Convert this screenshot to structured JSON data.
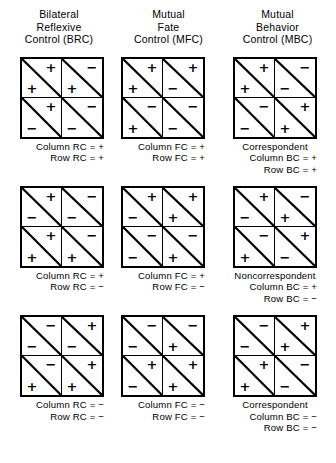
{
  "figure": {
    "column_headers": [
      {
        "name": "brc",
        "lines": [
          "Bilateral",
          "Reflexive",
          "Control (BRC)"
        ]
      },
      {
        "name": "mfc",
        "lines": [
          "Mutual",
          "Fate",
          "Control (MFC)"
        ]
      },
      {
        "name": "mbc",
        "lines": [
          "Mutual",
          "Behavior",
          "Control (MBC)"
        ]
      }
    ]
  },
  "chart_data": {
    "type": "table",
    "columns": [
      "Bilateral Reflexive Control (BRC)",
      "Mutual Fate Control (MFC)",
      "Mutual Behavior Control (MBC)"
    ],
    "rows": [
      "row 1",
      "row 2",
      "row 3"
    ],
    "legend": {
      "upper_right": "Column person outcome",
      "lower_left": "Row person outcome"
    },
    "matrices": [
      {
        "id": "brc-1",
        "column_label": "BRC",
        "cells": [
          [
            {
              "col": "+",
              "row": "+"
            },
            {
              "col": "−",
              "row": "+"
            }
          ],
          [
            {
              "col": "+",
              "row": "−"
            },
            {
              "col": "−",
              "row": "−"
            }
          ]
        ],
        "caption": {
          "title": "",
          "lines": [
            "Column RC = +",
            "Row RC = +"
          ]
        }
      },
      {
        "id": "mfc-1",
        "column_label": "MFC",
        "cells": [
          [
            {
              "col": "+",
              "row": "+"
            },
            {
              "col": "+",
              "row": "−"
            }
          ],
          [
            {
              "col": "−",
              "row": "+"
            },
            {
              "col": "−",
              "row": "−"
            }
          ]
        ],
        "caption": {
          "title": "",
          "lines": [
            "Column FC = +",
            "Row FC = +"
          ]
        }
      },
      {
        "id": "mbc-1",
        "column_label": "MBC",
        "cells": [
          [
            {
              "col": "+",
              "row": "+"
            },
            {
              "col": "−",
              "row": "−"
            }
          ],
          [
            {
              "col": "−",
              "row": "−"
            },
            {
              "col": "+",
              "row": "+"
            }
          ]
        ],
        "caption": {
          "title": "Correspondent",
          "lines": [
            "Column BC = +",
            "Row BC = +"
          ]
        }
      },
      {
        "id": "brc-2",
        "column_label": "BRC",
        "cells": [
          [
            {
              "col": "+",
              "row": "−"
            },
            {
              "col": "−",
              "row": "−"
            }
          ],
          [
            {
              "col": "+",
              "row": "+"
            },
            {
              "col": "−",
              "row": "+"
            }
          ]
        ],
        "caption": {
          "title": "",
          "lines": [
            "Column RC = +",
            "Row RC = −"
          ]
        }
      },
      {
        "id": "mfc-2",
        "column_label": "MFC",
        "cells": [
          [
            {
              "col": "+",
              "row": "−"
            },
            {
              "col": "+",
              "row": "+"
            }
          ],
          [
            {
              "col": "−",
              "row": "−"
            },
            {
              "col": "−",
              "row": "+"
            }
          ]
        ],
        "caption": {
          "title": "",
          "lines": [
            "Column FC = +",
            "Row FC = −"
          ]
        }
      },
      {
        "id": "mbc-2",
        "column_label": "MBC",
        "cells": [
          [
            {
              "col": "+",
              "row": "−"
            },
            {
              "col": "−",
              "row": "+"
            }
          ],
          [
            {
              "col": "−",
              "row": "+"
            },
            {
              "col": "+",
              "row": "−"
            }
          ]
        ],
        "caption": {
          "title": "Noncorrespondent",
          "lines": [
            "Column BC = +",
            "Row BC = −"
          ]
        }
      },
      {
        "id": "brc-3",
        "column_label": "BRC",
        "cells": [
          [
            {
              "col": "−",
              "row": "−"
            },
            {
              "col": "+",
              "row": "−"
            }
          ],
          [
            {
              "col": "−",
              "row": "+"
            },
            {
              "col": "+",
              "row": "+"
            }
          ]
        ],
        "caption": {
          "title": "",
          "lines": [
            "Column RC = −",
            "Row RC = −"
          ]
        }
      },
      {
        "id": "mfc-3",
        "column_label": "MFC",
        "cells": [
          [
            {
              "col": "−",
              "row": "−"
            },
            {
              "col": "−",
              "row": "+"
            }
          ],
          [
            {
              "col": "+",
              "row": "−"
            },
            {
              "col": "+",
              "row": "+"
            }
          ]
        ],
        "caption": {
          "title": "",
          "lines": [
            "Column FC = −",
            "Row FC = −"
          ]
        }
      },
      {
        "id": "mbc-3",
        "column_label": "MBC",
        "cells": [
          [
            {
              "col": "−",
              "row": "−"
            },
            {
              "col": "+",
              "row": "+"
            }
          ],
          [
            {
              "col": "+",
              "row": "+"
            },
            {
              "col": "−",
              "row": "−"
            }
          ]
        ],
        "caption": {
          "title": "Correspondent",
          "lines": [
            "Column BC = −",
            "Row BC = −"
          ]
        }
      }
    ]
  }
}
